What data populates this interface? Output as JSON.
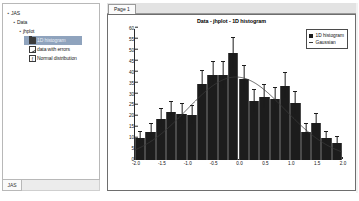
{
  "window": {
    "left_panel_tab_label": "JAS"
  },
  "tree": {
    "items": [
      {
        "label": "JAS",
        "depth": 0,
        "twisty": "▪",
        "icon": "none",
        "selected": false
      },
      {
        "label": "Data",
        "depth": 1,
        "twisty": "▪",
        "icon": "none",
        "selected": false
      },
      {
        "label": "jhplot",
        "depth": 2,
        "twisty": "▪",
        "icon": "none",
        "selected": false
      },
      {
        "label": "1D histogram",
        "depth": 3,
        "twisty": "",
        "icon": "folder-icon",
        "selected": true
      },
      {
        "label": "data with errors",
        "depth": 3,
        "twisty": "",
        "icon": "graph-icon",
        "selected": false
      },
      {
        "label": "Normal distribution",
        "depth": 3,
        "twisty": "",
        "icon": "function-icon",
        "selected": false
      }
    ]
  },
  "plot_panel": {
    "tab_label": "Page 1"
  },
  "chart_data": {
    "type": "bar",
    "title": "Data - jhplot - 1D  histogram",
    "xlabel": "",
    "ylabel": "",
    "xlim": [
      -2.0,
      2.0
    ],
    "ylim": [
      0,
      60
    ],
    "ytick_step": 5,
    "xtick_step": 0.5,
    "grid": false,
    "legend_position": "top-right",
    "ytick_labels": [
      "0",
      "5",
      "10",
      "15",
      "20",
      "25",
      "30",
      "35",
      "40",
      "45",
      "50",
      "55",
      "60"
    ],
    "xtick_labels": [
      "-2.0",
      "-1.5",
      "-1.0",
      "-0.5",
      "0.0",
      "0.5",
      "1.0",
      "1.5",
      "2.0"
    ],
    "legend": [
      {
        "label": "1D histogram",
        "marker": "filled-square",
        "color": "#1c1c1c"
      },
      {
        "label": "Gaussian",
        "marker": "line",
        "color": "#3a3a3a"
      }
    ],
    "series": [
      {
        "name": "1D histogram",
        "type": "histogram",
        "bin_centers": [
          -1.9,
          -1.7,
          -1.5,
          -1.3,
          -1.1,
          -0.9,
          -0.7,
          -0.5,
          -0.3,
          -0.1,
          0.1,
          0.3,
          0.5,
          0.7,
          0.9,
          1.1,
          1.3,
          1.5,
          1.7,
          1.9
        ],
        "bin_width": 0.2,
        "values": [
          10,
          13,
          19,
          22,
          21,
          20.5,
          35,
          39,
          39,
          49,
          37,
          27,
          29,
          28,
          34,
          26,
          13,
          17,
          10,
          8
        ],
        "errors": [
          3.2,
          3.6,
          4.4,
          4.7,
          4.6,
          4.5,
          5.9,
          6.2,
          6.2,
          7.0,
          6.1,
          5.2,
          5.4,
          5.3,
          5.8,
          5.1,
          3.6,
          4.1,
          3.2,
          2.8
        ]
      },
      {
        "name": "Gaussian",
        "type": "line",
        "amplitude": 38.0,
        "mean": -0.05,
        "sigma": 0.95,
        "color": "#3a3a3a"
      }
    ]
  }
}
